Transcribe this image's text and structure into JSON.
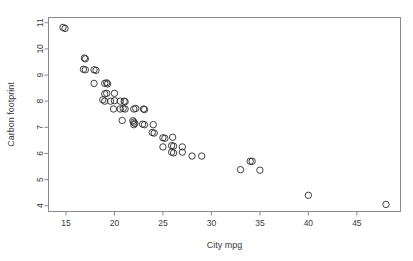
{
  "figure": {
    "background_color": "#ffffff",
    "frame_color": "#8a8a8a",
    "point_color": "#2b2b2b"
  },
  "chart_data": {
    "type": "scatter",
    "title": "",
    "xlabel": "City mpg",
    "ylabel": "Carbon footprint",
    "xlim": [
      13.2,
      49.5
    ],
    "ylim": [
      3.78,
      11.2
    ],
    "xticks": [
      15,
      20,
      25,
      30,
      35,
      40,
      45
    ],
    "xtick_labels": [
      "15",
      "20",
      "25",
      "30",
      "35",
      "40",
      "45"
    ],
    "yticks": [
      4,
      5,
      6,
      7,
      8,
      9,
      10,
      11
    ],
    "ytick_labels": [
      "4",
      "5",
      "6",
      "7",
      "8",
      "9",
      "10",
      "11"
    ],
    "grid": false,
    "legend": null,
    "marker": "open-circle",
    "marker_size": 3.2,
    "points": [
      [
        14.7,
        10.82
      ],
      [
        14.9,
        10.78
      ],
      [
        16.9,
        9.65
      ],
      [
        17.0,
        9.62
      ],
      [
        16.8,
        9.22
      ],
      [
        17.0,
        9.2
      ],
      [
        17.9,
        9.2
      ],
      [
        18.1,
        9.18
      ],
      [
        17.9,
        8.68
      ],
      [
        19.0,
        8.68
      ],
      [
        19.2,
        8.7
      ],
      [
        19.3,
        8.66
      ],
      [
        19.0,
        8.28
      ],
      [
        19.2,
        8.3
      ],
      [
        20.0,
        8.3
      ],
      [
        18.8,
        8.05
      ],
      [
        19.0,
        8.0
      ],
      [
        19.6,
        8.0
      ],
      [
        20.0,
        8.02
      ],
      [
        20.6,
        8.0
      ],
      [
        21.0,
        8.0
      ],
      [
        21.1,
        7.98
      ],
      [
        19.9,
        7.7
      ],
      [
        20.6,
        7.7
      ],
      [
        20.9,
        7.72
      ],
      [
        21.1,
        7.7
      ],
      [
        22.0,
        7.7
      ],
      [
        22.2,
        7.72
      ],
      [
        23.0,
        7.7
      ],
      [
        23.1,
        7.68
      ],
      [
        20.8,
        7.26
      ],
      [
        21.9,
        7.25
      ],
      [
        22.0,
        7.2
      ],
      [
        22.1,
        7.15
      ],
      [
        22.0,
        7.1
      ],
      [
        22.9,
        7.12
      ],
      [
        23.1,
        7.1
      ],
      [
        24.0,
        7.1
      ],
      [
        23.9,
        6.8
      ],
      [
        24.1,
        6.78
      ],
      [
        25.0,
        6.6
      ],
      [
        25.2,
        6.58
      ],
      [
        26.0,
        6.62
      ],
      [
        25.0,
        6.25
      ],
      [
        25.9,
        6.3
      ],
      [
        26.1,
        6.28
      ],
      [
        27.0,
        6.25
      ],
      [
        25.9,
        6.05
      ],
      [
        26.1,
        6.02
      ],
      [
        27.0,
        6.05
      ],
      [
        28.0,
        5.9
      ],
      [
        29.0,
        5.9
      ],
      [
        33.0,
        5.38
      ],
      [
        34.0,
        5.7
      ],
      [
        34.2,
        5.7
      ],
      [
        35.0,
        5.36
      ],
      [
        40.0,
        4.4
      ],
      [
        48.0,
        4.05
      ]
    ]
  }
}
